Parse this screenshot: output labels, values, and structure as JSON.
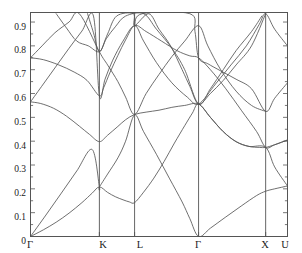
{
  "figure": {
    "kind": "band-structure-dispersion-plot",
    "background": "#ffffff",
    "frame_color": "#555555",
    "line_color": "#555555",
    "tick_color": "#555555",
    "text_color": "#1a1a1a"
  },
  "chart_data": {
    "type": "line",
    "title": "",
    "xlabel": "",
    "ylabel": "",
    "grid": false,
    "legend": null,
    "ylim": [
      0,
      0.94
    ],
    "ytick_labels": [
      "0",
      "0.1",
      "0.2",
      "0.3",
      "0.4",
      "0.5",
      "0.6",
      "0.7",
      "0.8",
      "0.9"
    ],
    "ytick_values": [
      0,
      0.1,
      0.2,
      0.3,
      0.4,
      0.5,
      0.6,
      0.7,
      0.8,
      0.9
    ],
    "yminor_step": 0.05,
    "xtick_labels": [
      "Γ",
      "K",
      "L",
      "Γ",
      "X",
      "U"
    ],
    "xtick_positions": [
      0,
      0.268,
      0.405,
      0.654,
      0.915,
      1.0
    ],
    "xlim": [
      0,
      1
    ],
    "high_symmetry_lines": [
      "K",
      "L",
      "Γ",
      "X"
    ],
    "series": [
      {
        "name": "branch-1-acoustic-lower",
        "points": [
          [
            0,
            0
          ],
          [
            0.05,
            0.028
          ],
          [
            0.1,
            0.06
          ],
          [
            0.15,
            0.098
          ],
          [
            0.2,
            0.142
          ],
          [
            0.24,
            0.182
          ],
          [
            0.268,
            0.208
          ],
          [
            0.3,
            0.185
          ],
          [
            0.33,
            0.167
          ],
          [
            0.36,
            0.154
          ],
          [
            0.385,
            0.145
          ],
          [
            0.405,
            0.142
          ],
          [
            0.44,
            0.186
          ],
          [
            0.48,
            0.245
          ],
          [
            0.52,
            0.315
          ],
          [
            0.56,
            0.392
          ],
          [
            0.6,
            0.465
          ],
          [
            0.63,
            0.518
          ],
          [
            0.654,
            0.556
          ],
          [
            0.7,
            0.5
          ],
          [
            0.75,
            0.44
          ],
          [
            0.8,
            0.398
          ],
          [
            0.85,
            0.378
          ],
          [
            0.89,
            0.374
          ],
          [
            0.915,
            0.374
          ],
          [
            0.95,
            0.385
          ],
          [
            1.0,
            0.405
          ]
        ]
      },
      {
        "name": "branch-2-acoustic-upper",
        "points": [
          [
            0,
            0
          ],
          [
            0.06,
            0.09
          ],
          [
            0.12,
            0.182
          ],
          [
            0.18,
            0.275
          ],
          [
            0.24,
            0.365
          ],
          [
            0.268,
            0.208
          ],
          [
            0.268,
            0.208
          ],
          [
            0.3,
            0.262
          ],
          [
            0.34,
            0.33
          ],
          [
            0.37,
            0.4
          ],
          [
            0.405,
            0.51
          ],
          [
            0.44,
            0.44
          ],
          [
            0.49,
            0.345
          ],
          [
            0.54,
            0.245
          ],
          [
            0.59,
            0.145
          ],
          [
            0.62,
            0.075
          ],
          [
            0.654,
            0.0
          ],
          [
            0.7,
            0.035
          ],
          [
            0.76,
            0.082
          ],
          [
            0.82,
            0.128
          ],
          [
            0.88,
            0.172
          ],
          [
            0.915,
            0.19
          ],
          [
            0.95,
            0.2
          ],
          [
            1.0,
            0.212
          ]
        ]
      },
      {
        "name": "branch-3",
        "points": [
          [
            0,
            0.565
          ],
          [
            0.04,
            0.558
          ],
          [
            0.09,
            0.538
          ],
          [
            0.14,
            0.505
          ],
          [
            0.19,
            0.463
          ],
          [
            0.23,
            0.428
          ],
          [
            0.268,
            0.398
          ],
          [
            0.3,
            0.425
          ],
          [
            0.34,
            0.462
          ],
          [
            0.37,
            0.49
          ],
          [
            0.405,
            0.512
          ],
          [
            0.45,
            0.522
          ],
          [
            0.5,
            0.53
          ],
          [
            0.55,
            0.542
          ],
          [
            0.6,
            0.55
          ],
          [
            0.654,
            0.556
          ],
          [
            0.7,
            0.5
          ],
          [
            0.75,
            0.44
          ],
          [
            0.8,
            0.398
          ],
          [
            0.85,
            0.378
          ],
          [
            0.915,
            0.374
          ],
          [
            0.95,
            0.292
          ],
          [
            1.0,
            0.212
          ]
        ]
      },
      {
        "name": "branch-4",
        "points": [
          [
            0,
            0.565
          ],
          [
            0.05,
            0.64
          ],
          [
            0.1,
            0.715
          ],
          [
            0.15,
            0.79
          ],
          [
            0.2,
            0.862
          ],
          [
            0.245,
            0.925
          ],
          [
            0.268,
            0.59
          ],
          [
            0.29,
            0.66
          ],
          [
            0.32,
            0.74
          ],
          [
            0.36,
            0.82
          ],
          [
            0.405,
            0.885
          ],
          [
            0.44,
            0.82
          ],
          [
            0.49,
            0.73
          ],
          [
            0.55,
            0.645
          ],
          [
            0.61,
            0.585
          ],
          [
            0.654,
            0.556
          ],
          [
            0.72,
            0.64
          ],
          [
            0.78,
            0.72
          ],
          [
            0.84,
            0.8
          ],
          [
            0.89,
            0.89
          ],
          [
            0.915,
            0.935
          ],
          [
            0.95,
            0.87
          ],
          [
            1.0,
            0.8
          ]
        ]
      },
      {
        "name": "branch-5",
        "points": [
          [
            0,
            0.75
          ],
          [
            0.05,
            0.742
          ],
          [
            0.11,
            0.72
          ],
          [
            0.17,
            0.69
          ],
          [
            0.22,
            0.655
          ],
          [
            0.268,
            0.59
          ],
          [
            0.285,
            0.625
          ],
          [
            0.31,
            0.69
          ],
          [
            0.34,
            0.76
          ],
          [
            0.37,
            0.825
          ],
          [
            0.405,
            0.885
          ],
          [
            0.45,
            0.86
          ],
          [
            0.51,
            0.82
          ],
          [
            0.57,
            0.78
          ],
          [
            0.62,
            0.758
          ],
          [
            0.654,
            0.75
          ],
          [
            0.7,
            0.7
          ],
          [
            0.76,
            0.62
          ],
          [
            0.82,
            0.53
          ],
          [
            0.88,
            0.44
          ],
          [
            0.915,
            0.374
          ],
          [
            0.95,
            0.385
          ],
          [
            1.0,
            0.405
          ]
        ]
      },
      {
        "name": "branch-6",
        "points": [
          [
            0,
            0.75
          ],
          [
            0.045,
            0.8
          ],
          [
            0.095,
            0.855
          ],
          [
            0.15,
            0.9
          ],
          [
            0.19,
            0.935
          ],
          [
            0.268,
            0.775
          ],
          [
            0.3,
            0.72
          ],
          [
            0.34,
            0.65
          ],
          [
            0.37,
            0.585
          ],
          [
            0.405,
            0.512
          ],
          [
            0.45,
            0.6
          ],
          [
            0.5,
            0.68
          ],
          [
            0.55,
            0.755
          ],
          [
            0.6,
            0.82
          ],
          [
            0.654,
            0.885
          ],
          [
            0.69,
            0.8
          ],
          [
            0.74,
            0.7
          ],
          [
            0.8,
            0.61
          ],
          [
            0.86,
            0.55
          ],
          [
            0.915,
            0.525
          ]
        ]
      },
      {
        "name": "branch-7",
        "points": [
          [
            0.1,
            0.935
          ],
          [
            0.14,
            0.875
          ],
          [
            0.18,
            0.82
          ],
          [
            0.225,
            0.8
          ],
          [
            0.268,
            0.775
          ],
          [
            0.295,
            0.83
          ],
          [
            0.33,
            0.88
          ],
          [
            0.37,
            0.925
          ],
          [
            0.44,
            0.935
          ],
          [
            0.49,
            0.87
          ],
          [
            0.55,
            0.79
          ],
          [
            0.6,
            0.7
          ],
          [
            0.654,
            0.556
          ],
          [
            0.7,
            0.62
          ],
          [
            0.75,
            0.7
          ],
          [
            0.8,
            0.78
          ],
          [
            0.86,
            0.86
          ],
          [
            0.9,
            0.925
          ]
        ]
      },
      {
        "name": "branch-8",
        "points": [
          [
            0.222,
            0.935
          ],
          [
            0.245,
            0.855
          ],
          [
            0.268,
            0.775
          ],
          [
            0.3,
            0.85
          ],
          [
            0.335,
            0.925
          ],
          [
            0.4,
            0.935
          ],
          [
            0.405,
            0.885
          ],
          [
            0.46,
            0.935
          ],
          [
            0.5,
            0.87
          ],
          [
            0.545,
            0.8
          ],
          [
            0.59,
            0.7
          ],
          [
            0.62,
            0.63
          ],
          [
            0.654,
            0.556
          ],
          [
            0.7,
            0.6
          ],
          [
            0.75,
            0.655
          ],
          [
            0.8,
            0.72
          ],
          [
            0.86,
            0.8
          ],
          [
            0.915,
            0.935
          ]
        ]
      },
      {
        "name": "branch-9",
        "points": [
          [
            0.405,
            0.885
          ],
          [
            0.435,
            0.935
          ],
          [
            0.62,
            0.935
          ],
          [
            0.64,
            0.86
          ],
          [
            0.654,
            0.75
          ],
          [
            0.69,
            0.725
          ],
          [
            0.74,
            0.695
          ],
          [
            0.8,
            0.66
          ],
          [
            0.86,
            0.62
          ],
          [
            0.915,
            0.525
          ],
          [
            0.95,
            0.58
          ],
          [
            1.0,
            0.645
          ]
        ]
      }
    ]
  },
  "ylabels": {
    "t0": "0",
    "t1": "0.1",
    "t2": "0.2",
    "t3": "0.3",
    "t4": "0.4",
    "t5": "0.5",
    "t6": "0.6",
    "t7": "0.7",
    "t8": "0.8",
    "t9": "0.9"
  },
  "xlabels": {
    "g1": "Γ",
    "k": "K",
    "l": "L",
    "g2": "Γ",
    "x": "X",
    "u": "U"
  }
}
